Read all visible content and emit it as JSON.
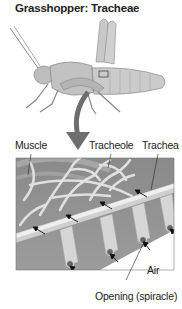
{
  "title": "Grasshopper: Tracheae",
  "labels": {
    "muscle": "Muscle",
    "tracheole": "Tracheole",
    "trachea": "Trachea",
    "air": "Air",
    "opening": "Opening (spiracle)"
  },
  "colors": {
    "body": "#b8b8b8",
    "arrow": "#6e6e6e",
    "panel_bg": "#8f8f8f",
    "tube": "#e6e6e6"
  }
}
